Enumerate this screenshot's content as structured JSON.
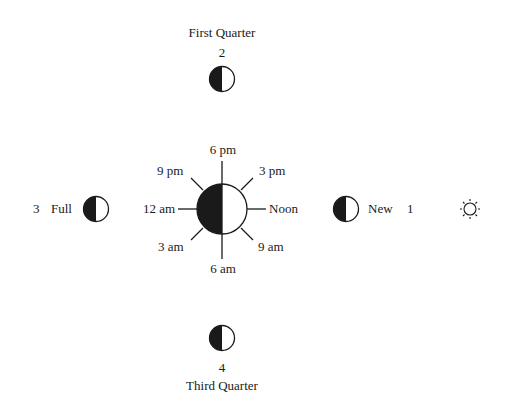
{
  "diagram": {
    "type": "moon phases around earth with local time",
    "earth": {
      "time_labels": {
        "top": "6 pm",
        "top_right": "3 pm",
        "right": "Noon",
        "bottom_right": "9 am",
        "bottom": "6 am",
        "bottom_left": "3 am",
        "left": "12 am",
        "top_left": "9 pm"
      }
    },
    "phases": [
      {
        "number": "1",
        "name": "New",
        "position": "right"
      },
      {
        "number": "2",
        "name": "First Quarter",
        "position": "top"
      },
      {
        "number": "3",
        "name": "Full",
        "position": "left"
      },
      {
        "number": "4",
        "name": "Third Quarter",
        "position": "bottom"
      }
    ],
    "sun": {
      "icon": "sun-icon",
      "position": "far-right"
    },
    "colors": {
      "ink": "#1a1a1a",
      "background": "#ffffff"
    }
  }
}
